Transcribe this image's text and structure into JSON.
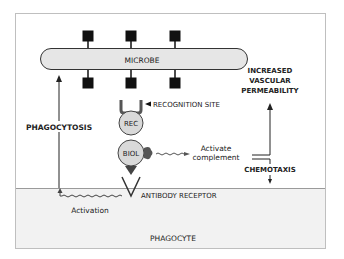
{
  "diagram": {
    "microbe_label": "MICROBE",
    "recognition_site_label": "RECOGNITION SITE",
    "rec_label": "REC",
    "biol_label": "BIOL",
    "activate_label_line1": "Activate",
    "activate_label_line2": "complement",
    "increased_line1": "INCREASED",
    "increased_line2": "VASCULAR",
    "increased_line3": "PERMEABILITY",
    "chemotaxis_label": "CHEMOTAXIS",
    "phagocytosis_label": "PHAGOCYTOSIS",
    "antibody_receptor_label": "ANTIBODY RECEPTOR",
    "activation_label": "Activation",
    "phagocyte_label": "PHAGOCYTE"
  },
  "colors": {
    "frame": "#bfbfbf",
    "microbe_fill": "#e6e6e6",
    "phagocyte_fill": "#f2f2f2",
    "circle_fill": "#d9d9d9",
    "ink": "#222222"
  }
}
